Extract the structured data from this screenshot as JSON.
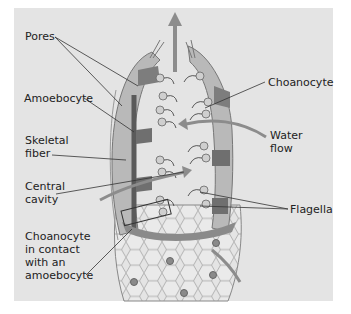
{
  "labels": {
    "pores": "Pores",
    "amoebocyte": "Amoebocyte",
    "skeletal_fiber": "Skeletal\nfiber",
    "central_cavity": "Central\ncavity",
    "choanocyte_contact": "Choanocyte\nin contact\nwith an\namoebocyte",
    "choanocyte": "Choanocyte",
    "water_flow": "Water\nflow",
    "flagella": "Flagella"
  },
  "colors": {
    "background": "#e4e4e4",
    "body_wall": "#8a8a8a",
    "cells": "#b5b5b5",
    "arrows": "#8c8c8c",
    "leader_lines": "#333333",
    "text": "#222222"
  }
}
